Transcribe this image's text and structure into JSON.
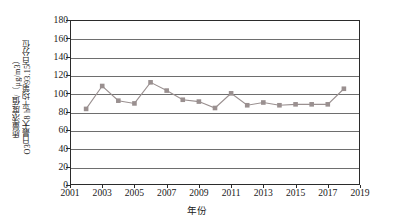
{
  "chart_data": {
    "type": "line",
    "title": "",
    "xlabel": "年份",
    "ylabel_line1": "O3日最大8 h平均第93.15百分位",
    "ylabel_line2": "质量浓度值/（μg/m3）",
    "ylabel_full": "O₃日最大8 h平均第93.15百分位质量浓度值/（μg/m³）",
    "x": [
      2002,
      2003,
      2004,
      2005,
      2006,
      2007,
      2008,
      2009,
      2010,
      2011,
      2012,
      2013,
      2014,
      2015,
      2016,
      2017,
      2018
    ],
    "values": [
      83,
      108,
      92,
      89,
      112,
      103,
      93,
      91,
      84,
      100,
      87,
      90,
      87,
      88,
      88,
      88,
      105
    ],
    "xlim": [
      2001,
      2019
    ],
    "ylim": [
      0,
      180
    ],
    "ytick_step": 20,
    "xtick_step": 2,
    "xticks": [
      "2001",
      "2003",
      "2005",
      "2007",
      "2009",
      "2011",
      "2013",
      "2015",
      "2017",
      "2019"
    ],
    "yticks": [
      "0",
      "20",
      "40",
      "60",
      "80",
      "100",
      "120",
      "140",
      "160",
      "180"
    ],
    "grid": "horizontal",
    "legend": "none",
    "series_color": "#9a9090",
    "marker": "square",
    "axis_color": "#2b2b2b",
    "gridline_color": "#6e6e6e"
  }
}
